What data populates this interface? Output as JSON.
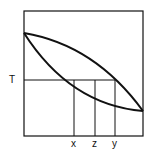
{
  "diagram": {
    "type": "binary phase diagram (lens)",
    "y_label": "T",
    "x_markers": [
      "x",
      "z",
      "y"
    ],
    "colors": {
      "line": "#111111",
      "background": "#ffffff"
    }
  }
}
